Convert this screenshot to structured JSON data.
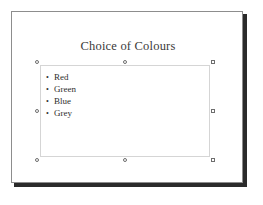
{
  "app": {
    "view": "slide-editor",
    "canvas_background": "#ffffff",
    "slide_background": "#ffffff",
    "slide_border_color": "#8d8d8d",
    "slide_shadow_color": "#2b2b2b"
  },
  "slide": {
    "title": "Choice of Colours",
    "title_color": "#3a3a3a"
  },
  "body_placeholder": {
    "selected": true,
    "border_color": "#b6b6b6",
    "bullet_glyph": "•",
    "bullets": [
      {
        "label": "Red"
      },
      {
        "label": "Green"
      },
      {
        "label": "Blue"
      },
      {
        "label": "Grey"
      }
    ]
  },
  "selection_handles": [
    {
      "name": "handle-top-left",
      "position": "nw"
    },
    {
      "name": "handle-top-center",
      "position": "n"
    },
    {
      "name": "handle-top-right",
      "position": "ne"
    },
    {
      "name": "handle-middle-left",
      "position": "w"
    },
    {
      "name": "handle-middle-right",
      "position": "e"
    },
    {
      "name": "handle-bottom-left",
      "position": "sw"
    },
    {
      "name": "handle-bottom-center",
      "position": "s"
    },
    {
      "name": "handle-bottom-right",
      "position": "se"
    }
  ]
}
